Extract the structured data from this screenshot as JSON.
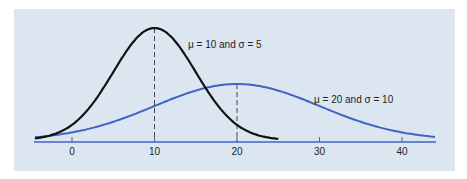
{
  "chart_data": {
    "type": "line",
    "title": "",
    "xlabel": "",
    "ylabel": "",
    "xlim": [
      -5,
      45
    ],
    "x_ticks": [
      0,
      10,
      20,
      30,
      40
    ],
    "grid": false,
    "legend": "inline annotations",
    "background": "#dbe6f0",
    "series": [
      {
        "name": "μ = 10 and σ = 5",
        "mean": 10,
        "sd": 5,
        "x_range": [
          -4.5,
          25
        ],
        "color": "#111111",
        "label_pos": [
          17,
          "near peak, right"
        ]
      },
      {
        "name": "μ = 20 and σ = 10",
        "mean": 20,
        "sd": 10,
        "x_range": [
          -4.5,
          44
        ],
        "color": "#3f63c6",
        "label_pos": [
          33,
          "right tail, above curve"
        ]
      }
    ],
    "annotations": [
      {
        "type": "dashed-vline",
        "x": 10,
        "to": "peak of μ=10 curve"
      },
      {
        "type": "dashed-vline",
        "x": 20,
        "to": "peak of μ=20 curve"
      }
    ]
  },
  "labels": {
    "series1": "μ = 10 and σ = 5",
    "series2": "μ = 20 and σ = 10",
    "ticks": [
      "0",
      "10",
      "20",
      "30",
      "40"
    ]
  }
}
